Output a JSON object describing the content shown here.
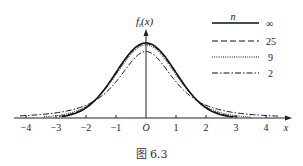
{
  "chart_data": {
    "type": "line",
    "title": "",
    "caption": "图 6.3",
    "xlabel": "x",
    "ylabel": "f_t(x)",
    "ylabel_main": "f",
    "ylabel_sub": "t",
    "ylabel_arg": "(x)",
    "origin_label": "O",
    "xlim": [
      -4.3,
      4.6
    ],
    "x_ticks": [
      -4,
      -3,
      -2,
      -1,
      1,
      2,
      3,
      4
    ],
    "x_tick_labels": [
      "−4",
      "−3",
      "−2",
      "−1",
      "1",
      "2",
      "3",
      "4"
    ],
    "grid": false,
    "legend": {
      "position": "upper right",
      "title": "n",
      "entries": [
        {
          "label": "∞",
          "style": "solid"
        },
        {
          "label": "25",
          "style": "dashed"
        },
        {
          "label": "9",
          "style": "dotted"
        },
        {
          "label": "2",
          "style": "dashdot"
        }
      ]
    },
    "series": [
      {
        "name": "∞",
        "dof": "inf",
        "style": "solid",
        "peak": 0.399,
        "x_range": [
          -2.8,
          2.9
        ]
      },
      {
        "name": "25",
        "dof": 25,
        "style": "dashed",
        "peak": 0.394,
        "x_range": [
          -2.9,
          3.1
        ]
      },
      {
        "name": "9",
        "dof": 9,
        "style": "dotted",
        "peak": 0.388,
        "x_range": [
          -3.4,
          3.5
        ]
      },
      {
        "name": "2",
        "dof": 2,
        "style": "dashdot",
        "peak": 0.354,
        "x_range": [
          -4.2,
          4.4
        ]
      }
    ]
  }
}
